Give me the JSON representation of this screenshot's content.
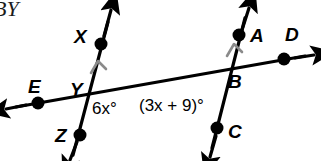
{
  "figure": {
    "kind": "geometry-diagram",
    "corner_text": "BY",
    "stroke_color": "#000000",
    "mark_color": "#8a8a8a",
    "background": "#ffffff",
    "points": [
      {
        "id": "X",
        "label": "X",
        "x": 101,
        "y": 44,
        "label_x": 74,
        "label_y": 27
      },
      {
        "id": "E",
        "label": "E",
        "x": 38,
        "y": 103,
        "label_x": 28,
        "label_y": 77
      },
      {
        "id": "Y",
        "label": "Y",
        "x": 90,
        "y": 97,
        "label_x": 70,
        "label_y": 80
      },
      {
        "id": "Z",
        "label": "Z",
        "x": 80,
        "y": 135,
        "label_x": 55,
        "label_y": 126
      },
      {
        "id": "A",
        "label": "A",
        "x": 239,
        "y": 35,
        "label_x": 250,
        "label_y": 26
      },
      {
        "id": "D",
        "label": "D",
        "x": 284,
        "y": 59,
        "label_x": 285,
        "label_y": 25
      },
      {
        "id": "B",
        "label": "B",
        "x": 222,
        "y": 78,
        "label_x": 228,
        "label_y": 72
      },
      {
        "id": "C",
        "label": "C",
        "x": 217,
        "y": 128,
        "label_x": 228,
        "label_y": 122
      }
    ],
    "lines": [
      {
        "id": "line-XZ",
        "name": "line-xz",
        "from": "X",
        "to": "Z",
        "parallel_mark": true
      },
      {
        "id": "line-AC",
        "name": "line-ac",
        "from": "A",
        "to": "C",
        "parallel_mark": true
      },
      {
        "id": "line-ED",
        "name": "transversal-ed",
        "from": "E",
        "to": "D",
        "parallel_mark": false
      }
    ],
    "angles": [
      {
        "id": "angle-6x",
        "vertex": "Y",
        "text": "6x°",
        "expression": "6x",
        "unit": "°",
        "label_x": 92,
        "label_y": 100
      },
      {
        "id": "angle-3x-plus-9",
        "vertex": "B",
        "text": "(3x + 9)°",
        "expression": "(3x + 9)",
        "unit": "°",
        "label_x": 139,
        "label_y": 97
      }
    ]
  }
}
